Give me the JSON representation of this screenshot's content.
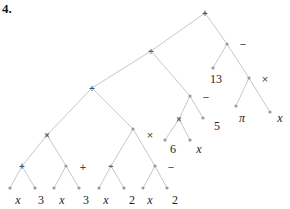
{
  "heading": "4.",
  "tree": {
    "nodes": [
      {
        "id": "root",
        "x": 205,
        "y": 13,
        "op": "+"
      },
      {
        "id": "div1",
        "x": 151,
        "y": 51,
        "op": "÷"
      },
      {
        "id": "minus1",
        "x": 227,
        "y": 44,
        "op": ""
      },
      {
        "id": "leaf13",
        "x": 213,
        "y": 68,
        "op": ""
      },
      {
        "id": "times1",
        "x": 249,
        "y": 78,
        "op": ""
      },
      {
        "id": "leafpi",
        "x": 236,
        "y": 106,
        "op": ""
      },
      {
        "id": "leafx1",
        "x": 270,
        "y": 112,
        "op": ""
      },
      {
        "id": "div2",
        "x": 92,
        "y": 88,
        "op": "÷"
      },
      {
        "id": "minus2",
        "x": 190,
        "y": 96,
        "op": ""
      },
      {
        "id": "times2",
        "x": 179,
        "y": 119,
        "op": "×"
      },
      {
        "id": "leaf5",
        "x": 203,
        "y": 118,
        "op": ""
      },
      {
        "id": "leaf6",
        "x": 165,
        "y": 140,
        "op": ""
      },
      {
        "id": "leafx2",
        "x": 190,
        "y": 140,
        "op": ""
      },
      {
        "id": "times3",
        "x": 47,
        "y": 135,
        "op": "×"
      },
      {
        "id": "times4",
        "x": 133,
        "y": 129,
        "op": ""
      },
      {
        "id": "plus1",
        "x": 22,
        "y": 166,
        "op": "+"
      },
      {
        "id": "plus2",
        "x": 66,
        "y": 166,
        "op": ""
      },
      {
        "id": "minus3",
        "x": 111,
        "y": 166,
        "op": "−"
      },
      {
        "id": "minus4",
        "x": 155,
        "y": 166,
        "op": ""
      },
      {
        "id": "l1",
        "x": 10,
        "y": 188,
        "op": ""
      },
      {
        "id": "l2",
        "x": 35,
        "y": 188,
        "op": ""
      },
      {
        "id": "l3",
        "x": 54,
        "y": 188,
        "op": ""
      },
      {
        "id": "l4",
        "x": 79,
        "y": 188,
        "op": ""
      },
      {
        "id": "l5",
        "x": 99,
        "y": 188,
        "op": ""
      },
      {
        "id": "l6",
        "x": 124,
        "y": 188,
        "op": ""
      },
      {
        "id": "l7",
        "x": 143,
        "y": 188,
        "op": ""
      },
      {
        "id": "l8",
        "x": 167,
        "y": 188,
        "op": ""
      }
    ],
    "edges": [
      [
        "root",
        "div1"
      ],
      [
        "root",
        "minus1"
      ],
      [
        "minus1",
        "leaf13"
      ],
      [
        "minus1",
        "times1"
      ],
      [
        "times1",
        "leafpi"
      ],
      [
        "times1",
        "leafx1"
      ],
      [
        "div1",
        "div2"
      ],
      [
        "div1",
        "minus2"
      ],
      [
        "minus2",
        "times2"
      ],
      [
        "minus2",
        "leaf5"
      ],
      [
        "times2",
        "leaf6"
      ],
      [
        "times2",
        "leafx2"
      ],
      [
        "div2",
        "times3"
      ],
      [
        "div2",
        "times4"
      ],
      [
        "times3",
        "plus1"
      ],
      [
        "times3",
        "plus2"
      ],
      [
        "times4",
        "minus3"
      ],
      [
        "times4",
        "minus4"
      ],
      [
        "plus1",
        "l1"
      ],
      [
        "plus1",
        "l2"
      ],
      [
        "plus2",
        "l3"
      ],
      [
        "plus2",
        "l4"
      ],
      [
        "minus3",
        "l5"
      ],
      [
        "minus3",
        "l6"
      ],
      [
        "minus4",
        "l7"
      ],
      [
        "minus4",
        "l8"
      ]
    ],
    "side_labels": [
      {
        "text": "−",
        "x": 243,
        "y": 48,
        "kind": "op"
      },
      {
        "text": "13",
        "x": 216,
        "y": 83,
        "kind": "num"
      },
      {
        "text": "×",
        "x": 265,
        "y": 83,
        "kind": "op"
      },
      {
        "text": "π",
        "x": 242,
        "y": 122,
        "kind": "ital"
      },
      {
        "text": "x",
        "x": 280,
        "y": 122,
        "kind": "ital"
      },
      {
        "text": "−",
        "x": 206,
        "y": 101,
        "kind": "op"
      },
      {
        "text": "5",
        "x": 217,
        "y": 130,
        "kind": "num"
      },
      {
        "text": "×",
        "x": 150,
        "y": 139,
        "kind": "op"
      },
      {
        "text": "6",
        "x": 173,
        "y": 153,
        "kind": "num"
      },
      {
        "text": "x",
        "x": 199,
        "y": 153,
        "kind": "ital"
      },
      {
        "text": "+",
        "x": 83,
        "y": 171,
        "kind": "op"
      },
      {
        "text": "−",
        "x": 171,
        "y": 171,
        "kind": "op"
      },
      {
        "text": "x",
        "x": 18,
        "y": 204,
        "kind": "ital"
      },
      {
        "text": "3",
        "x": 41,
        "y": 204,
        "kind": "num"
      },
      {
        "text": "x",
        "x": 62,
        "y": 204,
        "kind": "ital"
      },
      {
        "text": "3",
        "x": 86,
        "y": 204,
        "kind": "num"
      },
      {
        "text": "x",
        "x": 106,
        "y": 204,
        "kind": "ital"
      },
      {
        "text": "2",
        "x": 132,
        "y": 204,
        "kind": "num"
      },
      {
        "text": "x",
        "x": 150,
        "y": 204,
        "kind": "ital"
      },
      {
        "text": "2",
        "x": 175,
        "y": 204,
        "kind": "num"
      }
    ]
  }
}
